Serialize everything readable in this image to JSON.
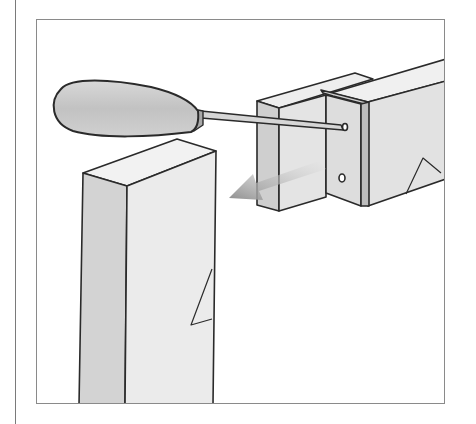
{
  "illustration": {
    "subject": "Screwdriver removing screw from corner bracket joining a horizontal rail to a vertical post",
    "elements": [
      "screwdriver",
      "vertical-post",
      "horizontal-rail",
      "corner-bracket",
      "screw-hole-top",
      "screw-hole-bottom",
      "direction-arrow"
    ]
  },
  "colors": {
    "line": "#2a2a2a",
    "wood_light": "#ececec",
    "wood_mid": "#dcdcdc",
    "wood_dark": "#c8c8c8",
    "handle": "#c9c9c9",
    "arrow": "#9a9a9a",
    "frame": "#8a8a8a"
  }
}
